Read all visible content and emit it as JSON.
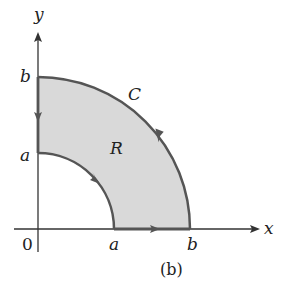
{
  "figure": {
    "caption": "(b)",
    "axes": {
      "x_label": "x",
      "y_label": "y",
      "origin_label": "0"
    },
    "ticks": {
      "x_inner": "a",
      "x_outer": "b",
      "y_inner": "a",
      "y_outer": "b"
    },
    "curve_label": "C",
    "region_label": "R",
    "colors": {
      "region_fill": "#d9d9d9",
      "boundary": "#555555",
      "axis": "#333333"
    }
  }
}
